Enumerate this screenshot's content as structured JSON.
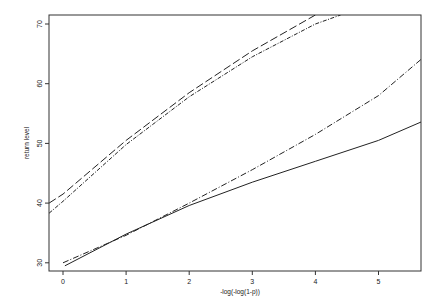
{
  "chart_data": {
    "type": "line",
    "title": "",
    "xlabel": "-log(-log(1-p))",
    "ylabel": "return level",
    "xlim": [
      -0.22,
      5.7
    ],
    "ylim": [
      28.5,
      71.5
    ],
    "x_ticks": [
      0,
      1,
      2,
      3,
      4,
      5
    ],
    "y_ticks": [
      30,
      40,
      50,
      60,
      70
    ],
    "grid": false,
    "legend": null,
    "series": [
      {
        "name": "solid",
        "style": "solid",
        "x": [
          0.03,
          1,
          2,
          3,
          4,
          5,
          5.7
        ],
        "values": [
          29.5,
          34.8,
          39.6,
          43.5,
          47.0,
          50.5,
          53.7
        ]
      },
      {
        "name": "dash-dot",
        "style": "dashdot",
        "x": [
          0,
          1,
          2,
          3,
          4,
          5,
          5.7
        ],
        "values": [
          30.0,
          34.6,
          40.0,
          45.6,
          51.5,
          58.0,
          64.3
        ]
      },
      {
        "name": "long-dash",
        "style": "longdash",
        "x": [
          -0.22,
          0,
          1,
          2,
          3,
          4,
          4.0
        ],
        "values": [
          40.0,
          41.5,
          50.5,
          58.5,
          65.5,
          71.5,
          71.5
        ]
      },
      {
        "name": "dotted-dash",
        "style": "dotdash",
        "x": [
          -0.22,
          0,
          1,
          2,
          3,
          4,
          4.4
        ],
        "values": [
          38.3,
          40.3,
          49.8,
          57.8,
          64.5,
          70.0,
          71.5
        ]
      }
    ]
  }
}
